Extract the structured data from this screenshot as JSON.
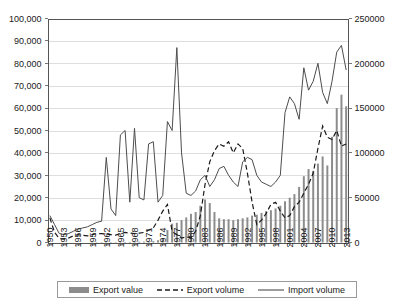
{
  "chart_data": {
    "type": "bar",
    "title": "",
    "xlabel": "",
    "ylabel": "",
    "grid": true,
    "legend_position": "bottom",
    "x": [
      1950,
      1951,
      1952,
      1953,
      1954,
      1955,
      1956,
      1957,
      1958,
      1959,
      1960,
      1961,
      1962,
      1963,
      1964,
      1965,
      1966,
      1967,
      1968,
      1969,
      1970,
      1971,
      1972,
      1973,
      1974,
      1975,
      1976,
      1977,
      1978,
      1979,
      1980,
      1981,
      1982,
      1983,
      1984,
      1985,
      1986,
      1987,
      1988,
      1989,
      1990,
      1991,
      1992,
      1993,
      1994,
      1995,
      1996,
      1997,
      1998,
      1999,
      2000,
      2001,
      2002,
      2003,
      2004,
      2005,
      2006,
      2007,
      2008,
      2009,
      2010,
      2011,
      2012,
      2013
    ],
    "xtick_labels": [
      "1950",
      "1953",
      "1956",
      "1959",
      "1962",
      "1965",
      "1968",
      "1971",
      "1974",
      "1977",
      "1980",
      "1983",
      "1986",
      "1989",
      "1992",
      "1995",
      "1998",
      "2001",
      "2004",
      "2007",
      "2010",
      "2013"
    ],
    "xtick_step": 3,
    "axes": {
      "left": {
        "label": "",
        "lim": [
          0,
          100000
        ],
        "ticks": [
          0,
          10000,
          20000,
          30000,
          40000,
          50000,
          60000,
          70000,
          80000,
          90000,
          100000
        ],
        "tick_labels": [
          "0",
          "10,000",
          "20,000",
          "30,000",
          "40,000",
          "50,000",
          "60,000",
          "70,000",
          "80,000",
          "90,000",
          "100,000"
        ]
      },
      "right": {
        "label": "",
        "lim": [
          0,
          250000
        ],
        "ticks": [
          0,
          50000,
          100000,
          150000,
          200000,
          250000
        ],
        "tick_labels": [
          "0",
          "50000",
          "100000",
          "150000",
          "200000",
          "250000"
        ]
      }
    },
    "series": [
      {
        "name": "Export value",
        "type": "bar",
        "axis": "right",
        "color": "#8c8c8c",
        "values": [
          300,
          300,
          300,
          300,
          300,
          300,
          300,
          300,
          300,
          400,
          400,
          400,
          500,
          500,
          500,
          600,
          600,
          700,
          800,
          900,
          1000,
          1200,
          1500,
          2500,
          5000,
          14000,
          21000,
          22000,
          25000,
          28000,
          32000,
          34000,
          41000,
          48000,
          44000,
          34000,
          27000,
          26000,
          26000,
          25000,
          26000,
          27000,
          28000,
          30000,
          31000,
          33000,
          35000,
          36000,
          38000,
          41000,
          46000,
          50000,
          54000,
          62000,
          74000,
          82000,
          80000,
          88000,
          96000,
          86000,
          118000,
          150000,
          165000,
          152000
        ]
      },
      {
        "name": "Export volume",
        "type": "line",
        "style": "dashed",
        "axis": "left",
        "color": "#1a1a1a",
        "values": [
          11000,
          4500,
          1800,
          1500,
          2000,
          3000,
          3500,
          3200,
          3000,
          3500,
          4000,
          4000,
          3800,
          3500,
          3300,
          4000,
          4500,
          4200,
          4000,
          4200,
          4500,
          5500,
          6500,
          10000,
          14000,
          17000,
          5000,
          3500,
          2000,
          2500,
          2200,
          5000,
          12000,
          26000,
          36000,
          41000,
          44000,
          43000,
          45000,
          40000,
          44000,
          42000,
          31000,
          18000,
          8000,
          10000,
          13000,
          17000,
          18000,
          14000,
          11000,
          12000,
          16000,
          18000,
          22000,
          26000,
          31000,
          42000,
          52000,
          47000,
          46000,
          50000,
          43000,
          44000
        ]
      },
      {
        "name": "Import volume",
        "type": "line",
        "style": "solid",
        "axis": "left",
        "color": "#4d4d4d",
        "values": [
          12000,
          8000,
          4000,
          3500,
          4000,
          5000,
          6000,
          6500,
          7000,
          8000,
          9000,
          9500,
          38000,
          15000,
          12000,
          48000,
          50000,
          18000,
          51000,
          20000,
          19000,
          44000,
          45000,
          18000,
          21000,
          54000,
          50000,
          87000,
          40000,
          22000,
          21000,
          23000,
          28000,
          30000,
          25000,
          28000,
          33000,
          34000,
          30000,
          27000,
          25000,
          36000,
          38000,
          37000,
          30000,
          27000,
          26000,
          25000,
          27000,
          30000,
          58000,
          65000,
          62000,
          55000,
          78000,
          68000,
          72000,
          80000,
          67000,
          62000,
          72000,
          85000,
          88000,
          77000
        ]
      }
    ]
  },
  "legend": {
    "entries": [
      {
        "label": "Export value",
        "marker": "bar-swatch"
      },
      {
        "label": "Export volume",
        "marker": "dashed-line-swatch"
      },
      {
        "label": "Import volume",
        "marker": "solid-line-swatch"
      }
    ]
  }
}
